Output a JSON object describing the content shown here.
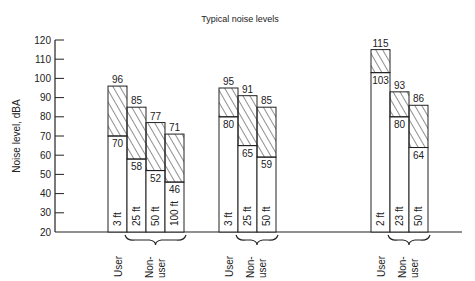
{
  "chart_data": {
    "type": "bar",
    "subtype": "floating-range-bar",
    "title": "Typical noise levels",
    "xlabel": "",
    "ylabel": "Noise level, dBA",
    "ylim": [
      20,
      120
    ],
    "yticks": [
      20,
      30,
      40,
      50,
      60,
      70,
      80,
      90,
      100,
      110,
      120
    ],
    "grid": false,
    "legend": null,
    "groups": [
      {
        "bars": [
          {
            "role": "User",
            "distance": "3 ft",
            "low": 70,
            "high": 96
          },
          {
            "role": "Non-user",
            "distance": "25 ft",
            "low": 58,
            "high": 85
          },
          {
            "role": "Non-user",
            "distance": "50 ft",
            "low": 52,
            "high": 77
          },
          {
            "role": "Non-user",
            "distance": "100 ft",
            "low": 46,
            "high": 71
          }
        ],
        "labels": {
          "user": "User",
          "nonuser_line1": "Non-",
          "nonuser_line2": "user"
        }
      },
      {
        "bars": [
          {
            "role": "User",
            "distance": "3 ft",
            "low": 80,
            "high": 95
          },
          {
            "role": "Non-user",
            "distance": "25 ft",
            "low": 65,
            "high": 91
          },
          {
            "role": "Non-user",
            "distance": "50 ft",
            "low": 59,
            "high": 85
          }
        ],
        "labels": {
          "user": "User",
          "nonuser_line1": "Non-",
          "nonuser_line2": "user"
        }
      },
      {
        "bars": [
          {
            "role": "User",
            "distance": "2 ft",
            "low": 103,
            "high": 115
          },
          {
            "role": "Non-user",
            "distance": "23 ft",
            "low": 80,
            "high": 93
          },
          {
            "role": "Non-user",
            "distance": "50 ft",
            "low": 64,
            "high": 86
          }
        ],
        "labels": {
          "user": "User",
          "nonuser_line1": "Non-",
          "nonuser_line2": "user"
        }
      }
    ]
  },
  "layout": {
    "group_x": [
      108,
      219,
      371
    ],
    "bar_width": 19
  }
}
